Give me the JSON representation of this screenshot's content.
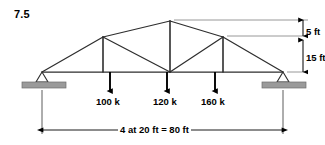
{
  "figure": {
    "problem_number": "7.5",
    "type": "truss-free-body-diagram",
    "stroke_color": "#1a1a1a",
    "member_color": "#3a3a3a",
    "support_fill": "#9a9a9a",
    "arrow_color": "#000000"
  },
  "loads": [
    {
      "label": "100 k",
      "magnitude": 100,
      "unit": "k",
      "node_x_ft": 20
    },
    {
      "label": "120 k",
      "magnitude": 120,
      "unit": "k",
      "node_x_ft": 40
    },
    {
      "label": "160 k",
      "magnitude": 160,
      "unit": "k",
      "node_x_ft": 60
    }
  ],
  "dimensions": {
    "rise_top": "5 ft",
    "rise_bottom": "15 ft",
    "span": "4 at 20 ft = 80 ft"
  },
  "geometry": {
    "span_ft": 80,
    "panels": 4,
    "panel_length_ft": 20,
    "height_at_knee_ft": 15,
    "height_at_apex_ft": 20,
    "supports": [
      {
        "kind": "pin",
        "x_ft": 0
      },
      {
        "kind": "roller",
        "x_ft": 80
      }
    ],
    "bottom_chord_nodes_ft": [
      0,
      20,
      40,
      60,
      80
    ],
    "top_chord_nodes_ft": [
      0,
      20,
      40,
      60,
      80
    ]
  }
}
